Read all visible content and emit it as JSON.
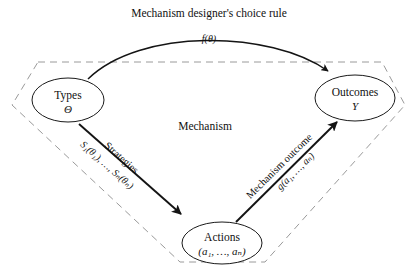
{
  "diagram": {
    "title_top": "Mechanism designer's choice rule",
    "region_label": "Mechanism",
    "nodes": [
      {
        "id": "types",
        "label": "Types",
        "sublabel": "Θ",
        "cx": 68,
        "cy": 100,
        "rx": 36,
        "ry": 22
      },
      {
        "id": "outcomes",
        "label": "Outcomes",
        "sublabel": "Y",
        "cx": 355,
        "cy": 98,
        "rx": 40,
        "ry": 23
      },
      {
        "id": "actions",
        "label": "Actions",
        "sublabel": "(a₁, …, aₙ)",
        "cx": 222,
        "cy": 243,
        "rx": 40,
        "ry": 21
      }
    ],
    "edges": [
      {
        "id": "choice-rule",
        "label": "Mechanism designer's choice rule",
        "formula": "f(θ)",
        "from": "types",
        "to": "outcomes",
        "style": "arc"
      },
      {
        "id": "strategies",
        "label": "Strategies",
        "formula": "S₁(θ₁), …, Sₙ(θₙ)",
        "from": "types",
        "to": "actions",
        "style": "straight"
      },
      {
        "id": "mechanism-outcome",
        "label": "Mechanism outcome",
        "formula": "g(a₁, …, aₙ)",
        "from": "actions",
        "to": "outcomes",
        "style": "straight"
      }
    ],
    "boundary": {
      "name": "mechanism-boundary",
      "points": "38,62 382,62 405,105 265,262 180,262 12,105",
      "stroke": "#9a9a9a",
      "dash": "7 5"
    },
    "colors": {
      "stroke": "#141414",
      "boundary": "#9a9a9a",
      "background": "#ffffff",
      "text": "#111111"
    }
  }
}
